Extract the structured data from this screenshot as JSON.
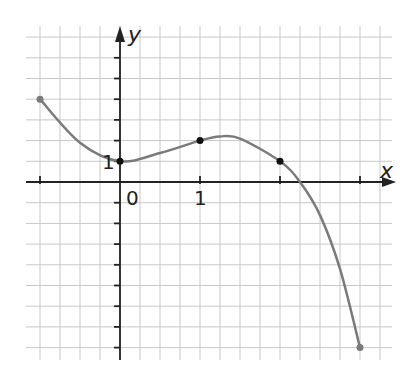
{
  "chart_data": {
    "type": "line",
    "title": "",
    "xlabel": "x",
    "ylabel": "y",
    "xlim": [
      -1,
      3
    ],
    "ylim": [
      -8,
      7
    ],
    "grid": true,
    "grid_cells_per_x_unit": 4,
    "grid_cells_per_y_unit": 1,
    "tick_labels": {
      "origin": "0",
      "x_one": "1",
      "y_one": "1"
    },
    "series": [
      {
        "name": "f(x)",
        "curve": [
          [
            -1,
            4
          ],
          [
            -0.5,
            1.9
          ],
          [
            0,
            1
          ],
          [
            0.5,
            1.4
          ],
          [
            1,
            2
          ],
          [
            1.25,
            2.2
          ],
          [
            1.5,
            2.1
          ],
          [
            2,
            1
          ],
          [
            2.25,
            0
          ],
          [
            2.5,
            -1.6
          ],
          [
            2.75,
            -4.2
          ],
          [
            3,
            -8
          ]
        ],
        "marked_points": [
          [
            -1,
            4
          ],
          [
            0,
            1
          ],
          [
            1,
            2
          ],
          [
            2,
            1
          ],
          [
            3,
            -8
          ]
        ]
      }
    ],
    "colors": {
      "curve": "#7a7a7a",
      "points": "#111111",
      "grid": "#c8c8c8",
      "axis": "#222222"
    }
  }
}
